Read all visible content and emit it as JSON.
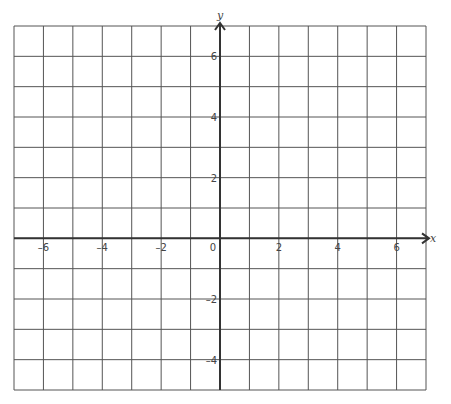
{
  "chart_data": {
    "type": "scatter",
    "title": "",
    "xlabel": "x",
    "ylabel": "y",
    "xlim": [
      -7,
      7
    ],
    "ylim": [
      -5,
      7
    ],
    "grid": true,
    "grid_step": 1,
    "x_ticks": [
      -6,
      -4,
      -2,
      0,
      2,
      4,
      6
    ],
    "x_tick_labels": [
      "–6",
      "–4",
      "–2",
      "0",
      "2",
      "4",
      "6"
    ],
    "y_ticks": [
      6,
      4,
      2,
      -2,
      -4
    ],
    "y_tick_labels": [
      "6",
      "4",
      "2",
      "–2",
      "–4"
    ],
    "series": [],
    "colors": {
      "grid": "#555555",
      "axis": "#333333",
      "text": "#444444"
    }
  }
}
